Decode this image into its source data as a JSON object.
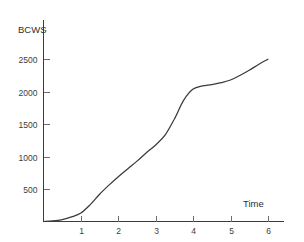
{
  "chart_data": {
    "type": "line",
    "title": "",
    "subtitle": "",
    "xlabel": "Time",
    "ylabel": "BCWS",
    "xlim": [
      0,
      6.35
    ],
    "ylim": [
      0,
      2700
    ],
    "grid": false,
    "legend": null,
    "x_ticks": [
      1,
      2,
      3,
      4,
      5,
      6
    ],
    "x_tick_labels": [
      "1",
      "2",
      "3",
      "4",
      "5",
      "6"
    ],
    "y_ticks": [
      500,
      1000,
      1500,
      2000,
      2500
    ],
    "y_tick_labels": [
      "500",
      "1000",
      "1500",
      "2000",
      "2500"
    ],
    "series": [
      {
        "name": "BCWS",
        "color": "#3a3a3a",
        "x": [
          0.0,
          0.25,
          0.5,
          0.75,
          1.0,
          1.25,
          1.5,
          1.75,
          2.0,
          2.25,
          2.5,
          2.75,
          3.0,
          3.25,
          3.5,
          3.75,
          4.0,
          4.25,
          4.5,
          4.75,
          5.0,
          5.25,
          5.5,
          5.75,
          6.0
        ],
        "y": [
          0,
          10,
          30,
          70,
          130,
          260,
          420,
          560,
          690,
          810,
          930,
          1060,
          1180,
          1330,
          1580,
          1870,
          2040,
          2090,
          2110,
          2140,
          2180,
          2250,
          2330,
          2420,
          2500
        ]
      }
    ],
    "annotations": []
  },
  "labels": {
    "y_axis_title": "BCWS",
    "x_axis_title": "Time"
  },
  "colors": {
    "curve": "#3a3a3a",
    "axis": "#3d3d3d",
    "tick": "#6e6e6e",
    "text": "#2e2e2e",
    "background": "#ffffff"
  }
}
